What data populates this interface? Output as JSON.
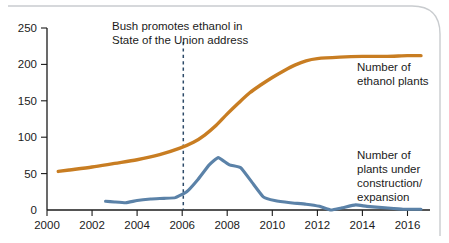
{
  "chart_data": {
    "type": "line",
    "title": "",
    "xlabel": "",
    "ylabel": "",
    "xlim": [
      2000,
      2017
    ],
    "ylim": [
      0,
      250
    ],
    "grid": false,
    "legend_position": "right-inline",
    "x_ticks": [
      "2000",
      "2002",
      "2004",
      "2006",
      "2008",
      "2010",
      "2012",
      "2014",
      "2016"
    ],
    "x_tick_values": [
      2000,
      2002,
      2004,
      2006,
      2008,
      2010,
      2012,
      2014,
      2016
    ],
    "y_ticks": [
      "0",
      "50",
      "100",
      "150",
      "200",
      "250"
    ],
    "y_tick_values": [
      0,
      50,
      100,
      150,
      200,
      250
    ],
    "series": [
      {
        "name": "Number of ethanol plants",
        "color": "#c87d22",
        "label_line1": "Number of",
        "label_line2": "ethanol plants",
        "x": [
          2000.5,
          2001,
          2002,
          2003,
          2004,
          2005,
          2005.9,
          2006.5,
          2007,
          2007.5,
          2008,
          2008.5,
          2009,
          2009.5,
          2010,
          2010.5,
          2011,
          2011.5,
          2012,
          2013,
          2014,
          2015,
          2016,
          2016.6
        ],
        "values": [
          53,
          55,
          59,
          64,
          69,
          76,
          85,
          93,
          103,
          116,
          132,
          147,
          161,
          172,
          182,
          191,
          199,
          205,
          208,
          210,
          211,
          211,
          212,
          212
        ]
      },
      {
        "name": "Number of plants under construction/expansion",
        "color": "#5b82a8",
        "label_line1": "Number of",
        "label_line2": "plants under",
        "label_line3": "construction/",
        "label_line4": "expansion",
        "x": [
          2002.6,
          2003,
          2003.5,
          2004,
          2004.6,
          2005.2,
          2005.7,
          2006.2,
          2006.7,
          2007.2,
          2007.6,
          2008.1,
          2008.6,
          2009.1,
          2009.6,
          2010.1,
          2010.8,
          2011.5,
          2012.1,
          2012.6,
          2013.1,
          2013.7,
          2014.2,
          2015,
          2015.8,
          2016.6
        ],
        "values": [
          12,
          11,
          10,
          13,
          15,
          16,
          17,
          25,
          42,
          62,
          72,
          62,
          58,
          38,
          18,
          13,
          10,
          8,
          5,
          0,
          3,
          7,
          5,
          3,
          1,
          1
        ]
      }
    ],
    "annotations": [
      {
        "name": "bush-ethanol-annotation",
        "line1": "Bush promotes ethanol in",
        "line2": "State of the Union address",
        "marker_x": 2006.05,
        "marker_style": "dashed-vertical",
        "marker_color": "#2c4a68"
      }
    ]
  }
}
